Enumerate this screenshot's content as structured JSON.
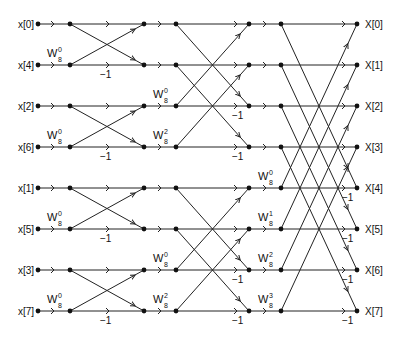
{
  "diagram": {
    "line_color": "#222222",
    "inputs": [
      "x[0]",
      "x[4]",
      "x[2]",
      "x[6]",
      "x[1]",
      "x[5]",
      "x[3]",
      "x[7]"
    ],
    "outputs": [
      "X[0]",
      "X[1]",
      "X[2]",
      "X[3]",
      "X[4]",
      "X[5]",
      "X[6]",
      "X[7]"
    ],
    "twiddle_base": "W",
    "twiddle_sub": "8",
    "stage1_twiddles": [
      {
        "row": 1,
        "exp": "0"
      },
      {
        "row": 3,
        "exp": "0"
      },
      {
        "row": 5,
        "exp": "0"
      },
      {
        "row": 7,
        "exp": "0"
      }
    ],
    "stage2_twiddles": [
      {
        "row": 2,
        "exp": "0"
      },
      {
        "row": 3,
        "exp": "2"
      },
      {
        "row": 6,
        "exp": "0"
      },
      {
        "row": 7,
        "exp": "2"
      }
    ],
    "stage3_twiddles": [
      {
        "row": 4,
        "exp": "0"
      },
      {
        "row": 5,
        "exp": "1"
      },
      {
        "row": 6,
        "exp": "2"
      },
      {
        "row": 7,
        "exp": "3"
      }
    ],
    "minus_one_label": "−1"
  }
}
